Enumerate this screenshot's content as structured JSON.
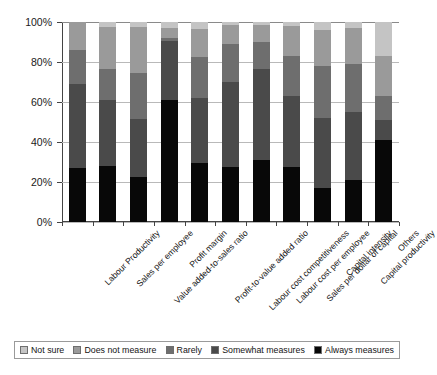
{
  "chart_data": {
    "type": "bar",
    "subtype": "stacked-100-percent",
    "title": "",
    "xlabel": "",
    "ylabel": "",
    "ylim": [
      0,
      100
    ],
    "ytick_labels": [
      "0%",
      "20%",
      "40%",
      "60%",
      "80%",
      "100%"
    ],
    "ytick_values": [
      0,
      20,
      40,
      60,
      80,
      100
    ],
    "grid": true,
    "legend_position": "bottom",
    "categories": [
      "Labour Productivity",
      "Sales per employee",
      "Value added-to-sales ratio",
      "Profit margin",
      "Profit-to-value added ratio",
      "Labour cost competitiveness",
      "Labour cost per employee",
      "Sales per dollar of capital",
      "Capital intensity",
      "Capital productivity",
      "Others"
    ],
    "series": [
      {
        "name": "Always measures",
        "color": "#080808",
        "values": [
          27,
          28,
          22.5,
          61,
          29.5,
          27.5,
          31,
          27.5,
          17,
          21,
          41
        ]
      },
      {
        "name": "Somewhat measures",
        "color": "#4a4a4a",
        "values": [
          42,
          33,
          29,
          29.5,
          32.5,
          42.5,
          45.5,
          35.5,
          35,
          34,
          10
        ]
      },
      {
        "name": "Rarely",
        "color": "#6e6e6e",
        "values": [
          17,
          15.5,
          23,
          1.5,
          20.5,
          19,
          13.5,
          20,
          26,
          24,
          12
        ]
      },
      {
        "name": "Does not measure",
        "color": "#9a9a9a",
        "values": [
          14,
          21,
          23,
          5,
          14,
          9.5,
          8.5,
          15,
          18,
          18,
          20
        ]
      },
      {
        "name": "Not sure",
        "color": "#c4c4c4",
        "values": [
          0,
          2.5,
          2.5,
          3,
          3.5,
          1.5,
          1.5,
          2,
          4,
          3,
          17
        ]
      }
    ]
  },
  "legend": {
    "items": [
      {
        "label": "Not sure",
        "color": "#c4c4c4"
      },
      {
        "label": "Does not measure",
        "color": "#9a9a9a"
      },
      {
        "label": "Rarely",
        "color": "#6e6e6e"
      },
      {
        "label": "Somewhat measures",
        "color": "#4a4a4a"
      },
      {
        "label": "Always measures",
        "color": "#080808"
      }
    ]
  }
}
